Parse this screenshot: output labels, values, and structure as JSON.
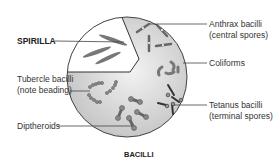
{
  "diagram": {
    "type": "bacterial morphology illustration",
    "labels": {
      "spirilla": "SPIRILLA",
      "tubercle_line1": "Tubercle bacilli",
      "tubercle_line2": "(note beading)",
      "diptheroids": "Diptheroids",
      "anthrax_line1": "Anthrax bacilli",
      "anthrax_line2": "(central spores)",
      "coliforms": "Coliforms",
      "tetanus_line1": "Tetanus bacilli",
      "tetanus_line2": "(terminal spores)",
      "bacilli": "BACILLI"
    },
    "colors": {
      "circle_fill": "#d6d6d6",
      "spirilla_sector": "#ffffff",
      "outline": "#444444",
      "organism": "#6a6a6a"
    }
  }
}
